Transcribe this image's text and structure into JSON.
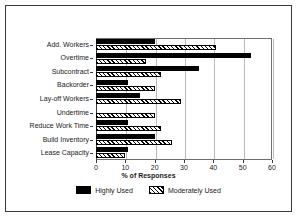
{
  "chart_data": {
    "type": "bar",
    "orientation": "horizontal",
    "title": "",
    "xlabel": "% of Responses",
    "ylabel": "",
    "xlim": [
      0,
      60
    ],
    "xticks": [
      0,
      10,
      20,
      30,
      40,
      50,
      60
    ],
    "grid": true,
    "grid_axis": "x",
    "legend_position": "bottom-center",
    "categories": [
      "Add. Workers",
      "Overtime",
      "Subcontract",
      "Backorder",
      "Lay-off Workers",
      "Undertime",
      "Reduce Work Time",
      "Build Inventory",
      "Lease Capacity"
    ],
    "series": [
      {
        "name": "Highly Used",
        "style": "solid-black",
        "color": "#000000",
        "values": [
          20,
          53,
          35,
          11,
          15,
          0,
          11,
          20,
          11
        ]
      },
      {
        "name": "Moderately Used",
        "style": "diagonal-hatch",
        "color": "#000000",
        "values": [
          41,
          17,
          22,
          20,
          29,
          20,
          22,
          26,
          10
        ]
      }
    ]
  },
  "axis": {
    "x_title": "% of Responses"
  },
  "legend": {
    "entries": [
      {
        "label": "Highly Used",
        "swatch": "solid"
      },
      {
        "label": "Moderately Used",
        "swatch": "hatch"
      }
    ]
  }
}
